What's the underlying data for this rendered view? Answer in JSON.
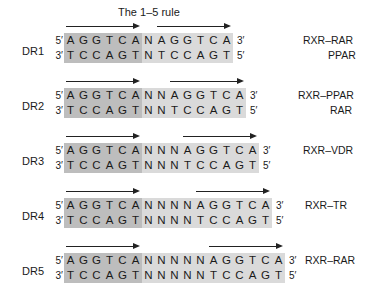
{
  "title": "The 1–5 rule",
  "colors": {
    "core_shade": "#bdbdbd",
    "spacer_shade": "#dadada",
    "text": "#1a1a1a"
  },
  "elements": [
    {
      "label": "DR1",
      "spacer": 1,
      "top": "5′",
      "top_end": "3′",
      "top_seq": "AGGTCANAGGTCA",
      "bottom": "3′",
      "bottom_end": "5′",
      "bottom_seq": "TCCAGTNTCCAGT",
      "receptors": [
        "RXR–RAR",
        "PPAR"
      ]
    },
    {
      "label": "DR2",
      "spacer": 2,
      "top": "5′",
      "top_end": "3′",
      "top_seq": "AGGTCANNAGGTCA",
      "bottom": "3′",
      "bottom_end": "5′",
      "bottom_seq": "TCCAGTNNTCCAGT",
      "receptors": [
        "RXR–PPAR",
        "RAR"
      ]
    },
    {
      "label": "DR3",
      "spacer": 3,
      "top": "5′",
      "top_end": "3′",
      "top_seq": "AGGTCANNNAGGTCA",
      "bottom": "3′",
      "bottom_end": "5′",
      "bottom_seq": "TCCAGTNNNTCCAGT",
      "receptors": [
        "RXR–VDR"
      ]
    },
    {
      "label": "DR4",
      "spacer": 4,
      "top": "5′",
      "top_end": "3′",
      "top_seq": "AGGTCANNNNAGGTCA",
      "bottom": "3′",
      "bottom_end": "5′",
      "bottom_seq": "TCCAGTNNNNTCCAGT",
      "receptors": [
        "RXR–TR"
      ]
    },
    {
      "label": "DR5",
      "spacer": 5,
      "top": "5′",
      "top_end": "3′",
      "top_seq": "AGGTCANNNNNAGGTCA",
      "bottom": "3′",
      "bottom_end": "5′",
      "bottom_seq": "TCCAGTNNNNNTCCAGT",
      "receptors": [
        "RXR–RAR"
      ]
    }
  ]
}
